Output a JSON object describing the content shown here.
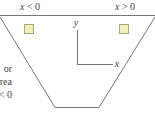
{
  "diagram": {
    "region_labels": {
      "left": "x < 0",
      "right": "x > 0"
    },
    "axes": {
      "y_label": "y",
      "x_label": "x"
    },
    "side_text_fragments": [
      "or",
      "rea",
      "< 0"
    ],
    "colors": {
      "line": "#777777",
      "square_fill": "#f2f0b8",
      "square_stroke": "#a9a77a",
      "text": "#444444"
    },
    "elements": {
      "top_line": "horizontal boundary",
      "trapezoid": "inverted trapezoid cross-section",
      "left_square": "element in x < 0 region",
      "right_square": "element in x > 0 region"
    }
  }
}
